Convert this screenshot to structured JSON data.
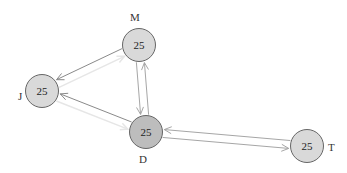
{
  "diagram": {
    "type": "directed-graph",
    "colors": {
      "node_fill": "#d9d9d9",
      "node_fill_highlight": "#bdbdbd",
      "node_border": "#666666",
      "edge_strong": "#8a8a8a",
      "edge_medium": "#a6a6a6",
      "edge_faint": "#e6e6e6",
      "background": "#ffffff"
    },
    "nodes": [
      {
        "id": "M",
        "label": "M",
        "value": "25",
        "cx": 139,
        "cy": 45,
        "r": 17,
        "highlight": false,
        "label_x": 130,
        "label_y": 12
      },
      {
        "id": "J",
        "label": "J",
        "value": "25",
        "cx": 42,
        "cy": 91,
        "r": 17,
        "highlight": false,
        "label_x": 18,
        "label_y": 91
      },
      {
        "id": "D",
        "label": "D",
        "value": "25",
        "cx": 146,
        "cy": 132,
        "r": 17,
        "highlight": true,
        "label_x": 139,
        "label_y": 154
      },
      {
        "id": "T",
        "label": "T",
        "value": "25",
        "cx": 307,
        "cy": 146,
        "r": 17,
        "highlight": false,
        "label_x": 328,
        "label_y": 142
      }
    ],
    "edges": [
      {
        "from": "M",
        "to": "J",
        "style": "strong"
      },
      {
        "from": "D",
        "to": "J",
        "style": "strong"
      },
      {
        "from": "J",
        "to": "M",
        "style": "faint"
      },
      {
        "from": "J",
        "to": "D",
        "style": "faint"
      },
      {
        "from": "D",
        "to": "M",
        "style": "medium"
      },
      {
        "from": "M",
        "to": "D",
        "style": "medium"
      },
      {
        "from": "D",
        "to": "T",
        "style": "medium"
      },
      {
        "from": "T",
        "to": "D",
        "style": "medium"
      }
    ]
  }
}
